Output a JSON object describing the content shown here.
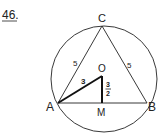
{
  "problem_number": "46.",
  "points": {
    "A": "A",
    "B": "B",
    "C": "C",
    "O": "O",
    "M": "M"
  },
  "edge_labels": {
    "AC": "5",
    "BC": "5",
    "AO": "3",
    "OM_num": "3",
    "OM_den": "2"
  },
  "colors": {
    "line": "#222222",
    "background": "#ffffff"
  }
}
